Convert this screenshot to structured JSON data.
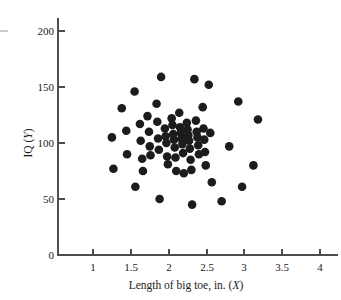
{
  "chart_data": {
    "type": "scatter",
    "title": "",
    "xlabel": "Length of big toe, in. (X)",
    "ylabel": "IQ (Y)",
    "xlabel_main": "Length of big toe, in. (",
    "xlabel_var": "X",
    "xlabel_close": ")",
    "ylabel_main": "IQ (",
    "ylabel_var": "Y",
    "ylabel_close": ")",
    "xlim": [
      0.7,
      4.2
    ],
    "ylim": [
      0,
      212
    ],
    "xticks": [
      1,
      1.5,
      2,
      2.5,
      3,
      3.5,
      4
    ],
    "xtick_labels": [
      "1",
      "1.5",
      "2",
      "2.5",
      "3",
      "3.5",
      "4"
    ],
    "yticks": [
      0,
      50,
      100,
      150,
      200
    ],
    "ytick_labels": [
      "0",
      "50",
      "100",
      "150",
      "200"
    ],
    "grid": false,
    "legend": null,
    "marker": "filled-circle",
    "marker_color": "#1c1c1c",
    "marker_size": 4.3,
    "n_points": 64,
    "annotation": "No correlation between big toe length and IQ; points form a circular cloud.",
    "points": [
      [
        1.25,
        105
      ],
      [
        1.27,
        77
      ],
      [
        1.38,
        131
      ],
      [
        1.44,
        111
      ],
      [
        1.45,
        90
      ],
      [
        1.55,
        146
      ],
      [
        1.56,
        61
      ],
      [
        1.62,
        117
      ],
      [
        1.63,
        102
      ],
      [
        1.65,
        86
      ],
      [
        1.66,
        75
      ],
      [
        1.72,
        124
      ],
      [
        1.74,
        110
      ],
      [
        1.75,
        97
      ],
      [
        1.76,
        89
      ],
      [
        1.84,
        135
      ],
      [
        1.85,
        119
      ],
      [
        1.86,
        104
      ],
      [
        1.87,
        94
      ],
      [
        1.88,
        50
      ],
      [
        1.9,
        159
      ],
      [
        1.95,
        113
      ],
      [
        1.96,
        106
      ],
      [
        1.97,
        100
      ],
      [
        1.98,
        88
      ],
      [
        1.99,
        81
      ],
      [
        2.04,
        122
      ],
      [
        2.05,
        116
      ],
      [
        2.06,
        108
      ],
      [
        2.07,
        103
      ],
      [
        2.08,
        96
      ],
      [
        2.09,
        87
      ],
      [
        2.1,
        75
      ],
      [
        2.14,
        127
      ],
      [
        2.15,
        114
      ],
      [
        2.16,
        109
      ],
      [
        2.17,
        104
      ],
      [
        2.18,
        99
      ],
      [
        2.19,
        91
      ],
      [
        2.2,
        73
      ],
      [
        2.24,
        118
      ],
      [
        2.25,
        112
      ],
      [
        2.26,
        107
      ],
      [
        2.27,
        102
      ],
      [
        2.28,
        95
      ],
      [
        2.29,
        85
      ],
      [
        2.3,
        76
      ],
      [
        2.31,
        45
      ],
      [
        2.34,
        157
      ],
      [
        2.36,
        120
      ],
      [
        2.37,
        110
      ],
      [
        2.38,
        105
      ],
      [
        2.39,
        98
      ],
      [
        2.4,
        90
      ],
      [
        2.45,
        132
      ],
      [
        2.46,
        113
      ],
      [
        2.47,
        103
      ],
      [
        2.48,
        92
      ],
      [
        2.49,
        80
      ],
      [
        2.53,
        152
      ],
      [
        2.55,
        109
      ],
      [
        2.57,
        65
      ],
      [
        2.7,
        48
      ],
      [
        2.8,
        97
      ],
      [
        2.92,
        137
      ],
      [
        2.97,
        61
      ],
      [
        3.12,
        80
      ],
      [
        3.18,
        121
      ]
    ]
  },
  "figure": {
    "background": "#ffffff",
    "axis_color": "#4d4d4d",
    "text_color": "#1a1a1a",
    "edge_mark_present": true
  }
}
